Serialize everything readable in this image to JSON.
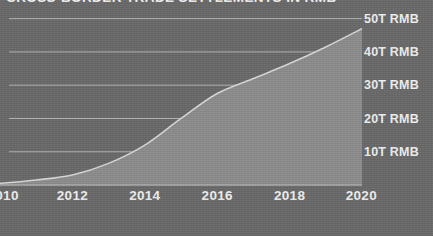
{
  "chart_data": {
    "type": "area",
    "title": "CROSS-BORDER TRADE SETTLEMENTS IN RMB",
    "xlabel": "",
    "ylabel": "",
    "x": [
      2010,
      2011,
      2012,
      2013,
      2014,
      2015,
      2016,
      2017,
      2018,
      2019,
      2020
    ],
    "values": [
      0.5,
      1.5,
      3.0,
      6.5,
      12.0,
      20.0,
      27.5,
      32.0,
      36.5,
      41.5,
      47.0
    ],
    "unit": "T RMB",
    "xlim": [
      2010,
      2020
    ],
    "ylim": [
      0,
      52
    ],
    "xticks": [
      2010,
      2012,
      2014,
      2016,
      2018,
      2020
    ],
    "xticklabels": [
      "2010",
      "2012",
      "2014",
      "2016",
      "2018",
      "2020"
    ],
    "yticks": [
      10,
      20,
      30,
      40,
      50
    ],
    "yticklabels": [
      "10T RMB",
      "20T RMB",
      "30T RMB",
      "40T RMB",
      "50T RMB"
    ],
    "grid": true,
    "legend": false,
    "series": [
      {
        "name": "Cross-border trade settlements",
        "values": [
          0.5,
          1.5,
          3.0,
          6.5,
          12.0,
          20.0,
          27.5,
          32.0,
          36.5,
          41.5,
          47.0
        ]
      }
    ],
    "colors": {
      "background": "#6b6b6b",
      "area_fill": "#8e8e8e",
      "line": "#d8d8d8",
      "gridline": "#b4b4b4",
      "text": "#f0f0f0"
    }
  },
  "axis": {
    "y_labels": [
      {
        "text": "50T RMB",
        "value": 50
      },
      {
        "text": "40T RMB",
        "value": 40
      },
      {
        "text": "30T RMB",
        "value": 30
      },
      {
        "text": "20T RMB",
        "value": 20
      },
      {
        "text": "10T RMB",
        "value": 10
      }
    ],
    "x_labels": [
      {
        "text": "2010",
        "value": 2010
      },
      {
        "text": "2012",
        "value": 2012
      },
      {
        "text": "2014",
        "value": 2014
      },
      {
        "text": "2016",
        "value": 2016
      },
      {
        "text": "2018",
        "value": 2018
      },
      {
        "text": "2020",
        "value": 2020
      }
    ]
  }
}
